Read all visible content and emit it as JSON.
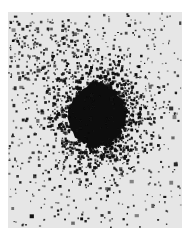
{
  "image": {
    "subject": "negative photograph of a star cluster",
    "description": "Dense dark circular core surrounded by scattered dark star points on a light gray field",
    "colors": {
      "page_background": "#ffffff",
      "field": "#e6e6e6",
      "stars": "#111111"
    }
  }
}
